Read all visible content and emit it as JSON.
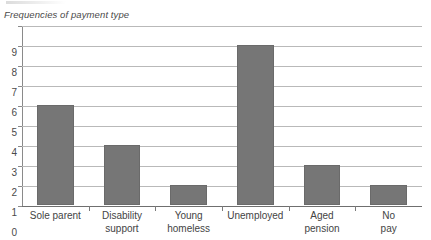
{
  "chart_data": {
    "type": "bar",
    "title": "Frequencies of payment type",
    "xlabel": "",
    "ylabel": "",
    "categories": [
      "Sole parent",
      "Disability support",
      "Young homeless",
      "Unemployed",
      "Aged pension",
      "No pay"
    ],
    "category_lines": [
      [
        "Sole parent"
      ],
      [
        "Disability",
        "support"
      ],
      [
        "Young",
        "homeless"
      ],
      [
        "Unemployed"
      ],
      [
        "Aged",
        "pension"
      ],
      [
        "No",
        "pay"
      ]
    ],
    "values": [
      5,
      3,
      1,
      8,
      2,
      1
    ],
    "ylim": [
      0,
      9
    ],
    "yticks": [
      "0",
      "1",
      "2",
      "3",
      "4",
      "5",
      "6",
      "7",
      "8",
      "9"
    ],
    "grid": true,
    "legend": false,
    "bar_color": "#767676",
    "grid_color": "#b9b9b9",
    "axis_color": "#6f6f6f",
    "text_color": "#444444"
  }
}
